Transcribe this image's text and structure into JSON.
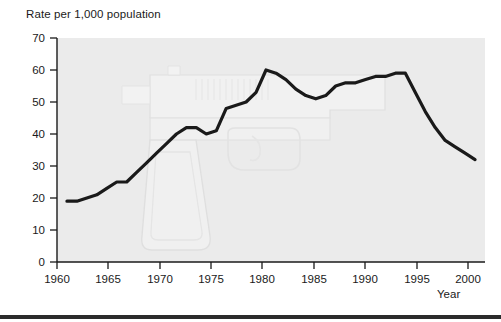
{
  "chart_data": {
    "type": "line",
    "title": "",
    "ylabel": "Rate per 1,000 population",
    "xlabel": "Year",
    "xlim": [
      1959,
      2002
    ],
    "ylim": [
      0,
      70
    ],
    "yticks": [
      0,
      10,
      20,
      30,
      40,
      50,
      60,
      70
    ],
    "xticks": [
      1960,
      1965,
      1970,
      1975,
      1980,
      1985,
      1990,
      1995,
      2000
    ],
    "grid": false,
    "legend": "none",
    "series": [
      {
        "name": "Rate per 1,000 population",
        "color": "#1a1a1a",
        "x": [
          1960,
          1961,
          1962,
          1963,
          1964,
          1965,
          1966,
          1967,
          1968,
          1969,
          1970,
          1971,
          1972,
          1973,
          1974,
          1975,
          1976,
          1977,
          1978,
          1979,
          1980,
          1981,
          1982,
          1983,
          1984,
          1985,
          1986,
          1987,
          1988,
          1989,
          1990,
          1991,
          1992,
          1993,
          1994,
          1995,
          1996,
          1997,
          1998,
          1999,
          2000,
          2001
        ],
        "values": [
          19,
          19,
          20,
          21,
          23,
          25,
          25,
          28,
          31,
          34,
          37,
          40,
          42,
          42,
          40,
          41,
          48,
          49,
          50,
          53,
          60,
          59,
          57,
          54,
          52,
          51,
          52,
          55,
          56,
          56,
          57,
          58,
          58,
          59,
          59,
          53,
          47,
          42,
          38,
          36,
          34,
          32
        ]
      }
    ],
    "annotations": [
      {
        "name": "handgun-watermark",
        "description": "faint light gray outline illustration of a semi-automatic pistol behind the plot"
      }
    ],
    "colors": {
      "line": "#1a1a1a",
      "plot_background": "#ebebeb",
      "axis": "#1a1a1a",
      "watermark": "#e0e0e0",
      "rule": "#2b2b2b"
    }
  }
}
